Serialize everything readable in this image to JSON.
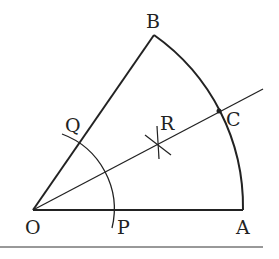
{
  "diagram": {
    "type": "geometry-sector-angle-bisector",
    "labels": {
      "O": "O",
      "A": "A",
      "B": "B",
      "C": "C",
      "P": "P",
      "Q": "Q",
      "R": "R"
    },
    "points": {
      "O": [
        33,
        210
      ],
      "A": [
        243,
        210
      ],
      "B": [
        154,
        35
      ],
      "C": [
        219,
        111
      ],
      "R": [
        158,
        142
      ],
      "P": [
        113,
        210
      ],
      "Q": [
        78,
        144
      ]
    },
    "colors": {
      "stroke": "#222222",
      "background": "#ffffff"
    }
  }
}
